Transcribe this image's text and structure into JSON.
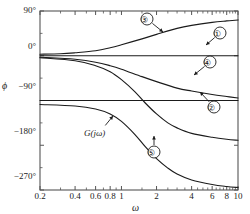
{
  "chart_data": {
    "type": "line",
    "title": "",
    "xlabel": "ω",
    "ylabel": "ϕ",
    "xscale": "log",
    "xlim": [
      0.2,
      10
    ],
    "ylim": [
      -270,
      90
    ],
    "grid": false,
    "legend": "annotations",
    "xticks": [
      0.2,
      0.4,
      0.6,
      0.8,
      1,
      2,
      4,
      6,
      8,
      10
    ],
    "xticklabels": [
      "0.2",
      "0.4",
      "0.6",
      "0.8",
      "1",
      "2",
      "4",
      "6",
      "8",
      "10"
    ],
    "yticks": [
      90,
      0,
      -90,
      -180,
      -270
    ],
    "yticklabels": [
      "90°",
      "0°",
      "−90°",
      "−180°",
      "−270°"
    ],
    "yminorticks": [
      45,
      -45,
      -135,
      -225
    ],
    "series": [
      {
        "name": "1",
        "label": "①",
        "description": "constant 0 degrees horizontal line",
        "x": [
          0.2,
          10
        ],
        "values": [
          0,
          0
        ]
      },
      {
        "name": "2",
        "label": "②",
        "description": "constant -90 degrees horizontal line",
        "x": [
          0.2,
          10
        ],
        "values": [
          -90,
          -90
        ]
      },
      {
        "name": "3",
        "label": "③",
        "description": "rising phase from 0 to +72 degrees",
        "x": [
          0.2,
          0.3,
          0.4,
          0.6,
          0.8,
          1,
          1.5,
          2,
          3,
          4,
          6,
          8,
          10
        ],
        "values": [
          3,
          4,
          6,
          10,
          16,
          22,
          34,
          43,
          55,
          61,
          67,
          70,
          72
        ]
      },
      {
        "name": "4",
        "label": "④",
        "description": "falling phase from 0 to about -85 degrees",
        "x": [
          0.2,
          0.3,
          0.4,
          0.6,
          0.8,
          1,
          1.5,
          2,
          3,
          4,
          6,
          8,
          10
        ],
        "values": [
          -3,
          -5,
          -7,
          -13,
          -20,
          -27,
          -42,
          -52,
          -65,
          -71,
          -78,
          -82,
          -85
        ]
      },
      {
        "name": "5",
        "label": "⑤",
        "description": "falling phase from 0 to about -170 degrees",
        "x": [
          0.2,
          0.4,
          0.6,
          0.8,
          1,
          1.3,
          1.6,
          2,
          2.5,
          3,
          4,
          6,
          8,
          10
        ],
        "values": [
          -4,
          -10,
          -20,
          -32,
          -48,
          -72,
          -95,
          -117,
          -135,
          -145,
          -156,
          -164,
          -168,
          -170
        ]
      },
      {
        "name": "G(jw)",
        "label": "G(jω)",
        "description": "overall open loop phase from about -98 to -265 degrees",
        "x": [
          0.2,
          0.4,
          0.6,
          0.8,
          1,
          1.3,
          1.6,
          2,
          2.5,
          3,
          4,
          6,
          8,
          10
        ],
        "values": [
          -98,
          -101,
          -107,
          -117,
          -132,
          -158,
          -183,
          -207,
          -226,
          -238,
          -250,
          -259,
          -263,
          -265
        ]
      }
    ],
    "annotations": [
      {
        "name": "callout-1",
        "text": "①",
        "target_series": "1"
      },
      {
        "name": "callout-2",
        "text": "②",
        "target_series": "2"
      },
      {
        "name": "callout-3",
        "text": "③",
        "target_series": "3"
      },
      {
        "name": "callout-4",
        "text": "④",
        "target_series": "4"
      },
      {
        "name": "callout-5",
        "text": "⑤",
        "target_series": "5"
      },
      {
        "name": "callout-g",
        "text": "G(jω)",
        "target_series": "G(jw)"
      }
    ],
    "colors": {
      "line": "#1b1b1b",
      "axis": "#555555",
      "background": "#ffffff"
    }
  },
  "axes": {
    "ylabel": "ϕ",
    "xlabel": "ω",
    "ytick_labels": [
      "90°",
      "0°",
      "−90°",
      "−180°",
      "−270°"
    ],
    "xtick_labels": [
      "0.2",
      "0.4",
      "0.6",
      "0.8",
      "1",
      "2",
      "4",
      "6",
      "8",
      "10"
    ]
  },
  "callouts": {
    "c1": "①",
    "c2": "②",
    "c3": "③",
    "c4": "④",
    "c5": "⑤",
    "cg": "G(jω)"
  }
}
